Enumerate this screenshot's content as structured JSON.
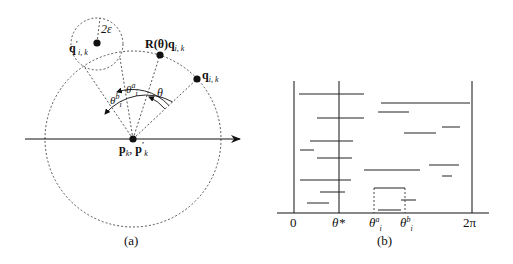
{
  "panel_a": {
    "caption": "(a)",
    "labels": {
      "eps": "2ε",
      "q_prime_main": "q",
      "q_prime_sub": "i, k",
      "q_prime_sup": "′",
      "rot_main": "R(θ)q",
      "rot_sub": "i, k",
      "q_main": "q",
      "q_sub": "i, k",
      "theta": "θ",
      "theta_a_main": "θ",
      "theta_a_sup": "a",
      "theta_a_sub": "i",
      "theta_b_main": "θ",
      "theta_b_sup": "b",
      "theta_b_sub": "i",
      "center_main": "p",
      "center_sub": "k",
      "center_sep": ", ",
      "center_main2": "p",
      "center_sub2": "k",
      "center_sup2": "′"
    }
  },
  "panel_b": {
    "caption": "(b)",
    "ticks": {
      "zero": "0",
      "theta_star": "θ*",
      "theta_a_main": "θ",
      "theta_a_sup": "a",
      "theta_a_sub": "i",
      "theta_b_main": "θ",
      "theta_b_sup": "b",
      "theta_b_sub": "i",
      "two_pi": "2π"
    }
  },
  "colors": {
    "ink": "#111111",
    "dashed": "#444444",
    "background": "#ffffff"
  }
}
